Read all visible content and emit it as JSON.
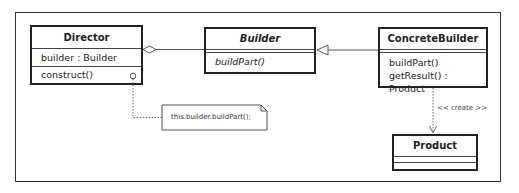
{
  "diagram": {
    "type": "UML class diagram",
    "classes": [
      {
        "name": "Director",
        "abstract": false,
        "attributes": [
          "builder : Builder"
        ],
        "operations": [
          "construct()"
        ]
      },
      {
        "name": "Builder",
        "abstract": true,
        "attributes": [],
        "operations": [
          "buildPart()"
        ]
      },
      {
        "name": "ConcreteBuilder",
        "abstract": false,
        "attributes": [],
        "operations": [
          "buildPart()",
          "getResult() : Product"
        ]
      },
      {
        "name": "Product",
        "abstract": false,
        "attributes": [],
        "operations": []
      }
    ],
    "relations": [
      {
        "type": "aggregation",
        "from": "Director",
        "to": "Builder"
      },
      {
        "type": "generalization",
        "from": "ConcreteBuilder",
        "to": "Builder"
      },
      {
        "type": "dependency",
        "from": "ConcreteBuilder",
        "to": "Product",
        "label": "<< create >>"
      }
    ],
    "note": {
      "text": "this.builder.buildPart();",
      "attached_to": "Director.construct()"
    }
  }
}
